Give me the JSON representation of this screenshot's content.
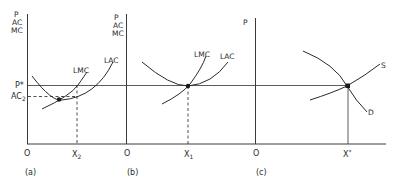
{
  "diagram": {
    "type": "economics-cost-curves",
    "shared_price_line": "P*",
    "panels": [
      {
        "id": "a",
        "caption": "(a)",
        "y_axis_labels": [
          "P",
          "AC",
          "MC"
        ],
        "origin": "O",
        "x_marker": {
          "base": "X",
          "sub": "2"
        },
        "price_label": "P*",
        "avg_cost_label": {
          "base": "AC",
          "sub": "2"
        },
        "curves": [
          {
            "label": "LMC"
          },
          {
            "label": "LAC"
          }
        ]
      },
      {
        "id": "b",
        "caption": "(b)",
        "y_axis_labels": [
          "P",
          "AC",
          "MC"
        ],
        "origin": "O",
        "x_marker": {
          "base": "X",
          "sub": "1"
        },
        "curves": [
          {
            "label": "LMC"
          },
          {
            "label": "LAC"
          }
        ]
      },
      {
        "id": "c",
        "caption": "(c)",
        "y_axis_labels": [
          "P"
        ],
        "origin": "O",
        "x_marker": {
          "base": "X",
          "sup": "*"
        },
        "curves": [
          {
            "label": "S"
          },
          {
            "label": "D"
          }
        ]
      }
    ]
  }
}
